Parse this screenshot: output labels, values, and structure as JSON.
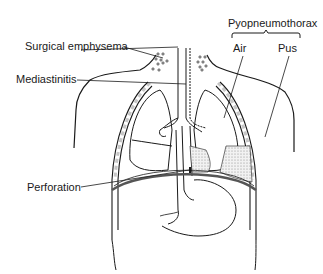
{
  "diagram": {
    "labels": {
      "surgical_emphysema": "Surgical emphysema",
      "mediastinitis": "Mediastinitis",
      "perforation": "Perforation",
      "pyopneumothorax": "Pyopneumothorax",
      "air": "Air",
      "pus": "Pus"
    },
    "colors": {
      "line": "#1a1a1a",
      "background": "#ffffff",
      "pus_fill": "#d9d9d9"
    }
  }
}
